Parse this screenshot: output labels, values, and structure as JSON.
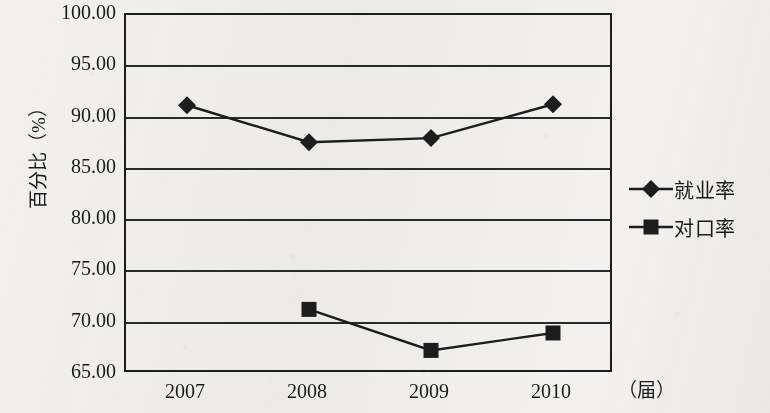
{
  "chart_data": {
    "type": "line",
    "title": "",
    "xlabel": "（届）",
    "ylabel": "百分比（%）",
    "categories": [
      "2007",
      "2008",
      "2009",
      "2010"
    ],
    "x_tick_labels": [
      "2007",
      "2008",
      "2009",
      "2010"
    ],
    "y_tick_labels": [
      "100.00",
      "95.00",
      "90.00",
      "85.00",
      "80.00",
      "75.00",
      "70.00",
      "65.00"
    ],
    "y_ticks": [
      100,
      95,
      90,
      85,
      80,
      75,
      70,
      65
    ],
    "ylim": [
      65,
      100
    ],
    "y_step": 5,
    "grid": "horizontal",
    "legend_position": "right",
    "series": [
      {
        "name": "就业率",
        "marker": "diamond",
        "values": [
          91.2,
          87.6,
          88.0,
          91.3
        ]
      },
      {
        "name": "对口率",
        "marker": "square",
        "values": [
          null,
          71.3,
          67.3,
          69.0
        ]
      }
    ],
    "colors": {
      "ink": "#1d1d1d",
      "paper": "#f2f1ef",
      "gridline": "#2a2a2a"
    }
  },
  "legend": {
    "items": [
      {
        "label": "就业率",
        "marker": "diamond-marker"
      },
      {
        "label": "对口率",
        "marker": "square-marker"
      }
    ]
  },
  "axes": {
    "y_title": "百分比（%）",
    "x_unit": "（届）"
  }
}
